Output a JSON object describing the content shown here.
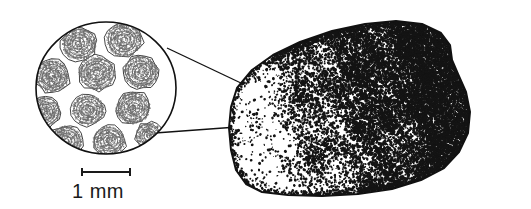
{
  "figure": {
    "name": "magnified-specimen-illustration",
    "caption_text": "",
    "background_color": "#ffffff",
    "ink_color": "#1a1a1a",
    "specimen": {
      "name": "stippled-rock-specimen",
      "description": "oolitic limestone hand specimen",
      "fill_color": "#ffffff",
      "stipple_color": "#141414",
      "outline_color": "#111111",
      "outline_width": 2.0,
      "outline_points": "231,107 237,88 252,70 273,55 300,42 332,31 365,24 396,21 422,24 441,33 450,45 452,60 458,74 466,92 470,112 468,133 459,152 444,168 421,180 392,189 358,194 322,196 288,195 262,192 246,184 236,170 231,150 229,128",
      "stipple_density_map": {
        "dense_regions": "upper-right, center-right, lower-right",
        "sparse_regions": "lower-left, left-edge",
        "peak_density": 0.52,
        "min_density": 0.16
      }
    },
    "inset": {
      "name": "magnified-circular-inset",
      "description": "circular magnified view showing ooid grains in cross-section",
      "center_x": 106,
      "center_y": 88,
      "radius_x": 70,
      "radius_y": 66,
      "outline_color": "#111111",
      "outline_width": 1.6,
      "fill_color": "#ffffff",
      "grain_count": 12,
      "grain_label": "ooid",
      "grain_fill": "#6b6b6b",
      "grains": [
        {
          "cx": 79,
          "cy": 44,
          "rx": 18,
          "ry": 17,
          "rot": -12
        },
        {
          "cx": 124,
          "cy": 40,
          "rx": 19,
          "ry": 18,
          "rot": 8
        },
        {
          "cx": 52,
          "cy": 76,
          "rx": 18,
          "ry": 17,
          "rot": 22
        },
        {
          "cx": 97,
          "cy": 73,
          "rx": 19,
          "ry": 18,
          "rot": -6
        },
        {
          "cx": 141,
          "cy": 72,
          "rx": 18,
          "ry": 17,
          "rot": 14
        },
        {
          "cx": 44,
          "cy": 112,
          "rx": 17,
          "ry": 16,
          "rot": -18
        },
        {
          "cx": 88,
          "cy": 110,
          "rx": 17,
          "ry": 16,
          "rot": 4
        },
        {
          "cx": 133,
          "cy": 108,
          "rx": 18,
          "ry": 17,
          "rot": -10
        },
        {
          "cx": 66,
          "cy": 141,
          "rx": 17,
          "ry": 16,
          "rot": 16
        },
        {
          "cx": 109,
          "cy": 141,
          "rx": 17,
          "ry": 16,
          "rot": -4
        },
        {
          "cx": 149,
          "cy": 136,
          "rx": 14,
          "ry": 14,
          "rot": 10
        },
        {
          "cx": 33,
          "cy": 47,
          "rx": 12,
          "ry": 14,
          "rot": 30
        }
      ]
    },
    "leader_lines": {
      "name": "callout-leader-lines",
      "color": "#111111",
      "width": 1.3,
      "lines": [
        {
          "name": "upper-leader-line",
          "x1": 167,
          "y1": 48,
          "x2": 243,
          "y2": 84
        },
        {
          "name": "lower-leader-line",
          "x1": 155,
          "y1": 133,
          "x2": 237,
          "y2": 127
        }
      ]
    },
    "scale_bar": {
      "name": "scale-bar",
      "label": "1 mm",
      "bar_x1": 82,
      "bar_x2": 130,
      "bar_y": 172,
      "cap_height": 8,
      "bar_color": "#1a1a1a",
      "bar_width": 2,
      "label_x": 72,
      "label_y": 198,
      "label_font_size": 20
    }
  }
}
